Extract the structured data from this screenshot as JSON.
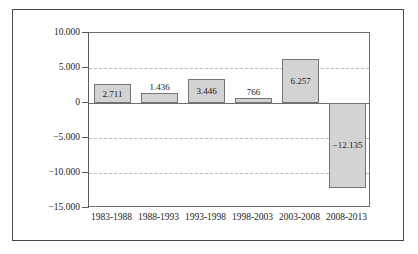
{
  "chart_data": {
    "type": "bar",
    "title": "",
    "subtitle": "",
    "xlabel": "",
    "ylabel": "",
    "categories": [
      "1983-1988",
      "1988-1993",
      "1993-1998",
      "1998-2003",
      "2003-2008",
      "2008-2013"
    ],
    "values": [
      2711,
      1436,
      3446,
      766,
      6257,
      -12135
    ],
    "value_labels": [
      "2.711",
      "1.436",
      "3.446",
      "766",
      "6.257",
      "−12.135"
    ],
    "ylim": [
      -15000,
      10000
    ],
    "y_ticks": [
      10000,
      5000,
      0,
      -5000,
      -10000,
      -15000
    ],
    "y_tick_labels": [
      "10.000",
      "5.000",
      "0",
      "−5.000",
      "−10.000",
      "−15.000"
    ],
    "grid": true,
    "grid_axis": "y",
    "legend": "none",
    "series": [
      {
        "name": "values",
        "values": [
          2711,
          1436,
          3446,
          766,
          6257,
          -12135
        ]
      }
    ],
    "colors": {
      "bar_fill": "#d3d3d3",
      "bar_border": "#757575",
      "gridline": "#b9b9b9",
      "axis": "#5a5a5a",
      "plot_border": "#6e6e6e",
      "figure_border": "#4a4a4a",
      "text": "#1d1d1d",
      "background": "#ffffff"
    }
  }
}
